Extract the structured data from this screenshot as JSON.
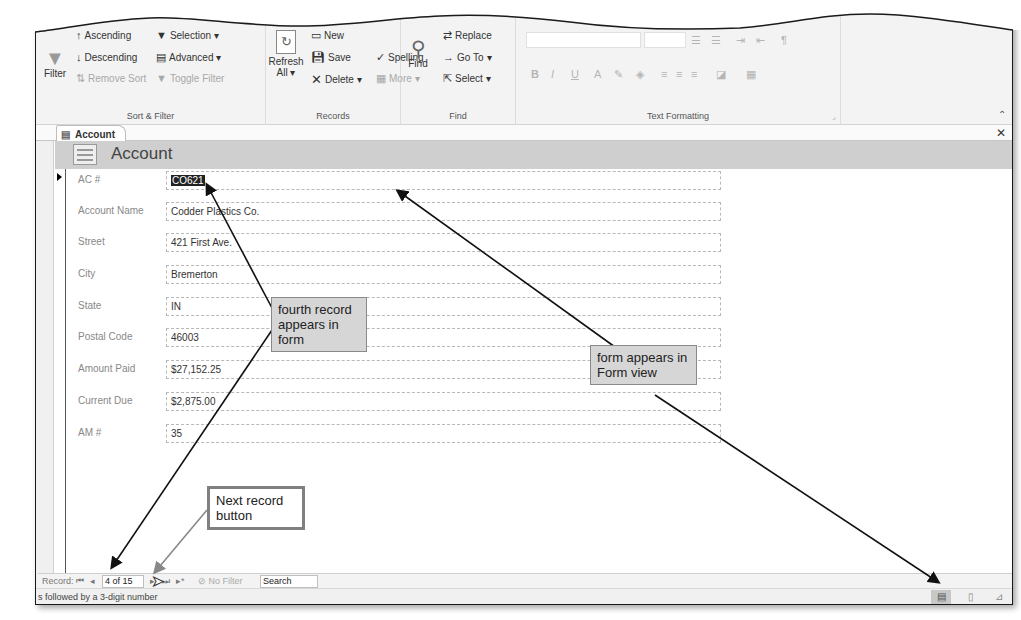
{
  "ribbon": {
    "sort_filter": {
      "label": "Sort & Filter",
      "filter": "Filter",
      "ascending": "Ascending",
      "descending": "Descending",
      "remove_sort": "Remove Sort",
      "selection": "Selection",
      "advanced": "Advanced",
      "toggle_filter": "Toggle Filter"
    },
    "records": {
      "label": "Records",
      "refresh": "Refresh",
      "refresh_all": "All",
      "new": "New",
      "save": "Save",
      "delete": "Delete",
      "spelling": "Spelling",
      "more": "More"
    },
    "find": {
      "label": "Find",
      "find": "Find",
      "replace": "Replace",
      "go_to": "Go To",
      "select": "Select"
    },
    "text_formatting": {
      "label": "Text Formatting",
      "bold": "B",
      "italic": "I",
      "underline": "U",
      "font_color": "A"
    }
  },
  "tab": {
    "label": "Account"
  },
  "form": {
    "title": "Account",
    "fields": [
      {
        "label": "AC #",
        "value": "CO621"
      },
      {
        "label": "Account Name",
        "value": "Codder Plastics Co."
      },
      {
        "label": "Street",
        "value": "421 First Ave."
      },
      {
        "label": "City",
        "value": "Bremerton"
      },
      {
        "label": "State",
        "value": "IN"
      },
      {
        "label": "Postal Code",
        "value": "46003"
      },
      {
        "label": "Amount Paid",
        "value": "$27,152.25"
      },
      {
        "label": "Current Due",
        "value": "$2,875.00"
      },
      {
        "label": "AM #",
        "value": "35"
      }
    ]
  },
  "navigation": {
    "record_label": "Record:",
    "first": "⏮",
    "previous": "◂",
    "current": "4 of 15",
    "next": "▸",
    "last": "⏭",
    "new": "▸*",
    "filter_status": "No Filter",
    "search": "Search"
  },
  "status_bar": {
    "text": "s followed by a 3-digit number"
  },
  "callouts": {
    "fourth_record": "fourth record appears in form",
    "form_view": "form appears in Form view",
    "next_record": "Next record button"
  }
}
